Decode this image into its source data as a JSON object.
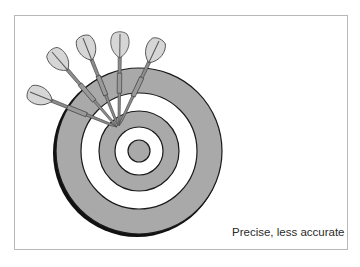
{
  "figure": {
    "caption": "Precise, less accurate",
    "colors": {
      "ring_fill": "#a9a9a9",
      "ring_white": "#ffffff",
      "outline": "#1a1a1a",
      "frame": "#b8b8b8",
      "flight_fill": "#d6d6d6",
      "shaft": "#8c8c8c"
    },
    "target": {
      "center": [
        139,
        151
      ],
      "rings": [
        {
          "r": 83,
          "fill": "gray"
        },
        {
          "r": 58,
          "fill": "white"
        },
        {
          "r": 40,
          "fill": "gray"
        },
        {
          "r": 24,
          "fill": "white"
        },
        {
          "r": 11,
          "fill": "gray"
        }
      ]
    },
    "darts": [
      {
        "tip": [
          117,
          127
        ],
        "tail": [
          30,
          92
        ]
      },
      {
        "tip": [
          117,
          127
        ],
        "tail": [
          52,
          52
        ]
      },
      {
        "tip": [
          118,
          126
        ],
        "tail": [
          83,
          38
        ]
      },
      {
        "tip": [
          119,
          125
        ],
        "tail": [
          120,
          34
        ]
      },
      {
        "tip": [
          119,
          126
        ],
        "tail": [
          159,
          41
        ]
      }
    ]
  }
}
